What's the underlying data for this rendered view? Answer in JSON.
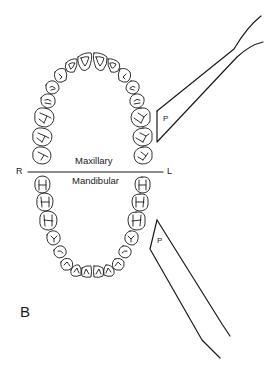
{
  "figure": {
    "panel_label": "B",
    "labels": {
      "maxillary": "Maxillary",
      "mandibular": "Mandibular",
      "right": "R",
      "left": "L"
    },
    "instruments": [
      {
        "id": "upper-probe",
        "label": "P",
        "arch": "maxillary",
        "side": "left"
      },
      {
        "id": "lower-probe",
        "label": "P",
        "arch": "mandibular",
        "side": "left"
      }
    ],
    "colors": {
      "line": "#1a1a1a",
      "background": "#ffffff"
    }
  }
}
